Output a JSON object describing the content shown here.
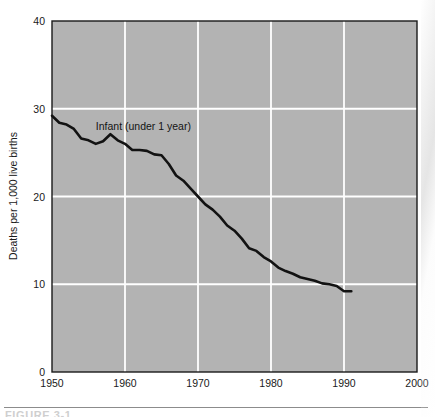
{
  "figure": {
    "caption_sliver": "FIGURE 3-1",
    "plot_background_color": "#b3b3b3",
    "gridline_color": "#ffffff",
    "frame_color": "#1a1a1a",
    "line_color": "#121212"
  },
  "chart_data": {
    "type": "line",
    "title": "",
    "subtitle": "",
    "xlabel": "",
    "ylabel": "Deaths per 1,000 live births",
    "xlim": [
      1950,
      2000
    ],
    "ylim": [
      0,
      40
    ],
    "xticks": [
      1950,
      1960,
      1970,
      1980,
      1990,
      2000
    ],
    "xticklabels": [
      "1950",
      "1960",
      "1970",
      "1980",
      "1990",
      "2000"
    ],
    "yticks": [
      0,
      10,
      20,
      30,
      40
    ],
    "yticklabels": [
      "0",
      "10",
      "20",
      "30",
      "40"
    ],
    "grid": true,
    "grid_axis": "both",
    "legend": "none",
    "annotations": [
      {
        "text": "Infant (under 1 year)",
        "x": 1956.0,
        "y": 27.6
      }
    ],
    "series": [
      {
        "name": "Infant (under 1 year)",
        "x": [
          1950,
          1951,
          1952,
          1953,
          1954,
          1955,
          1956,
          1957,
          1958,
          1959,
          1960,
          1961,
          1962,
          1963,
          1964,
          1965,
          1966,
          1967,
          1968,
          1969,
          1970,
          1971,
          1972,
          1973,
          1974,
          1975,
          1976,
          1977,
          1978,
          1979,
          1980,
          1981,
          1982,
          1983,
          1984,
          1985,
          1986,
          1987,
          1988,
          1989,
          1990,
          1991
        ],
        "values": [
          29.2,
          28.4,
          28.2,
          27.7,
          26.6,
          26.4,
          26.0,
          26.3,
          27.1,
          26.4,
          26.0,
          25.3,
          25.3,
          25.2,
          24.8,
          24.7,
          23.7,
          22.4,
          21.8,
          20.9,
          20.0,
          19.1,
          18.5,
          17.7,
          16.7,
          16.1,
          15.2,
          14.1,
          13.8,
          13.1,
          12.6,
          11.9,
          11.5,
          11.2,
          10.8,
          10.6,
          10.4,
          10.1,
          10.0,
          9.8,
          9.2,
          9.2
        ]
      }
    ]
  }
}
